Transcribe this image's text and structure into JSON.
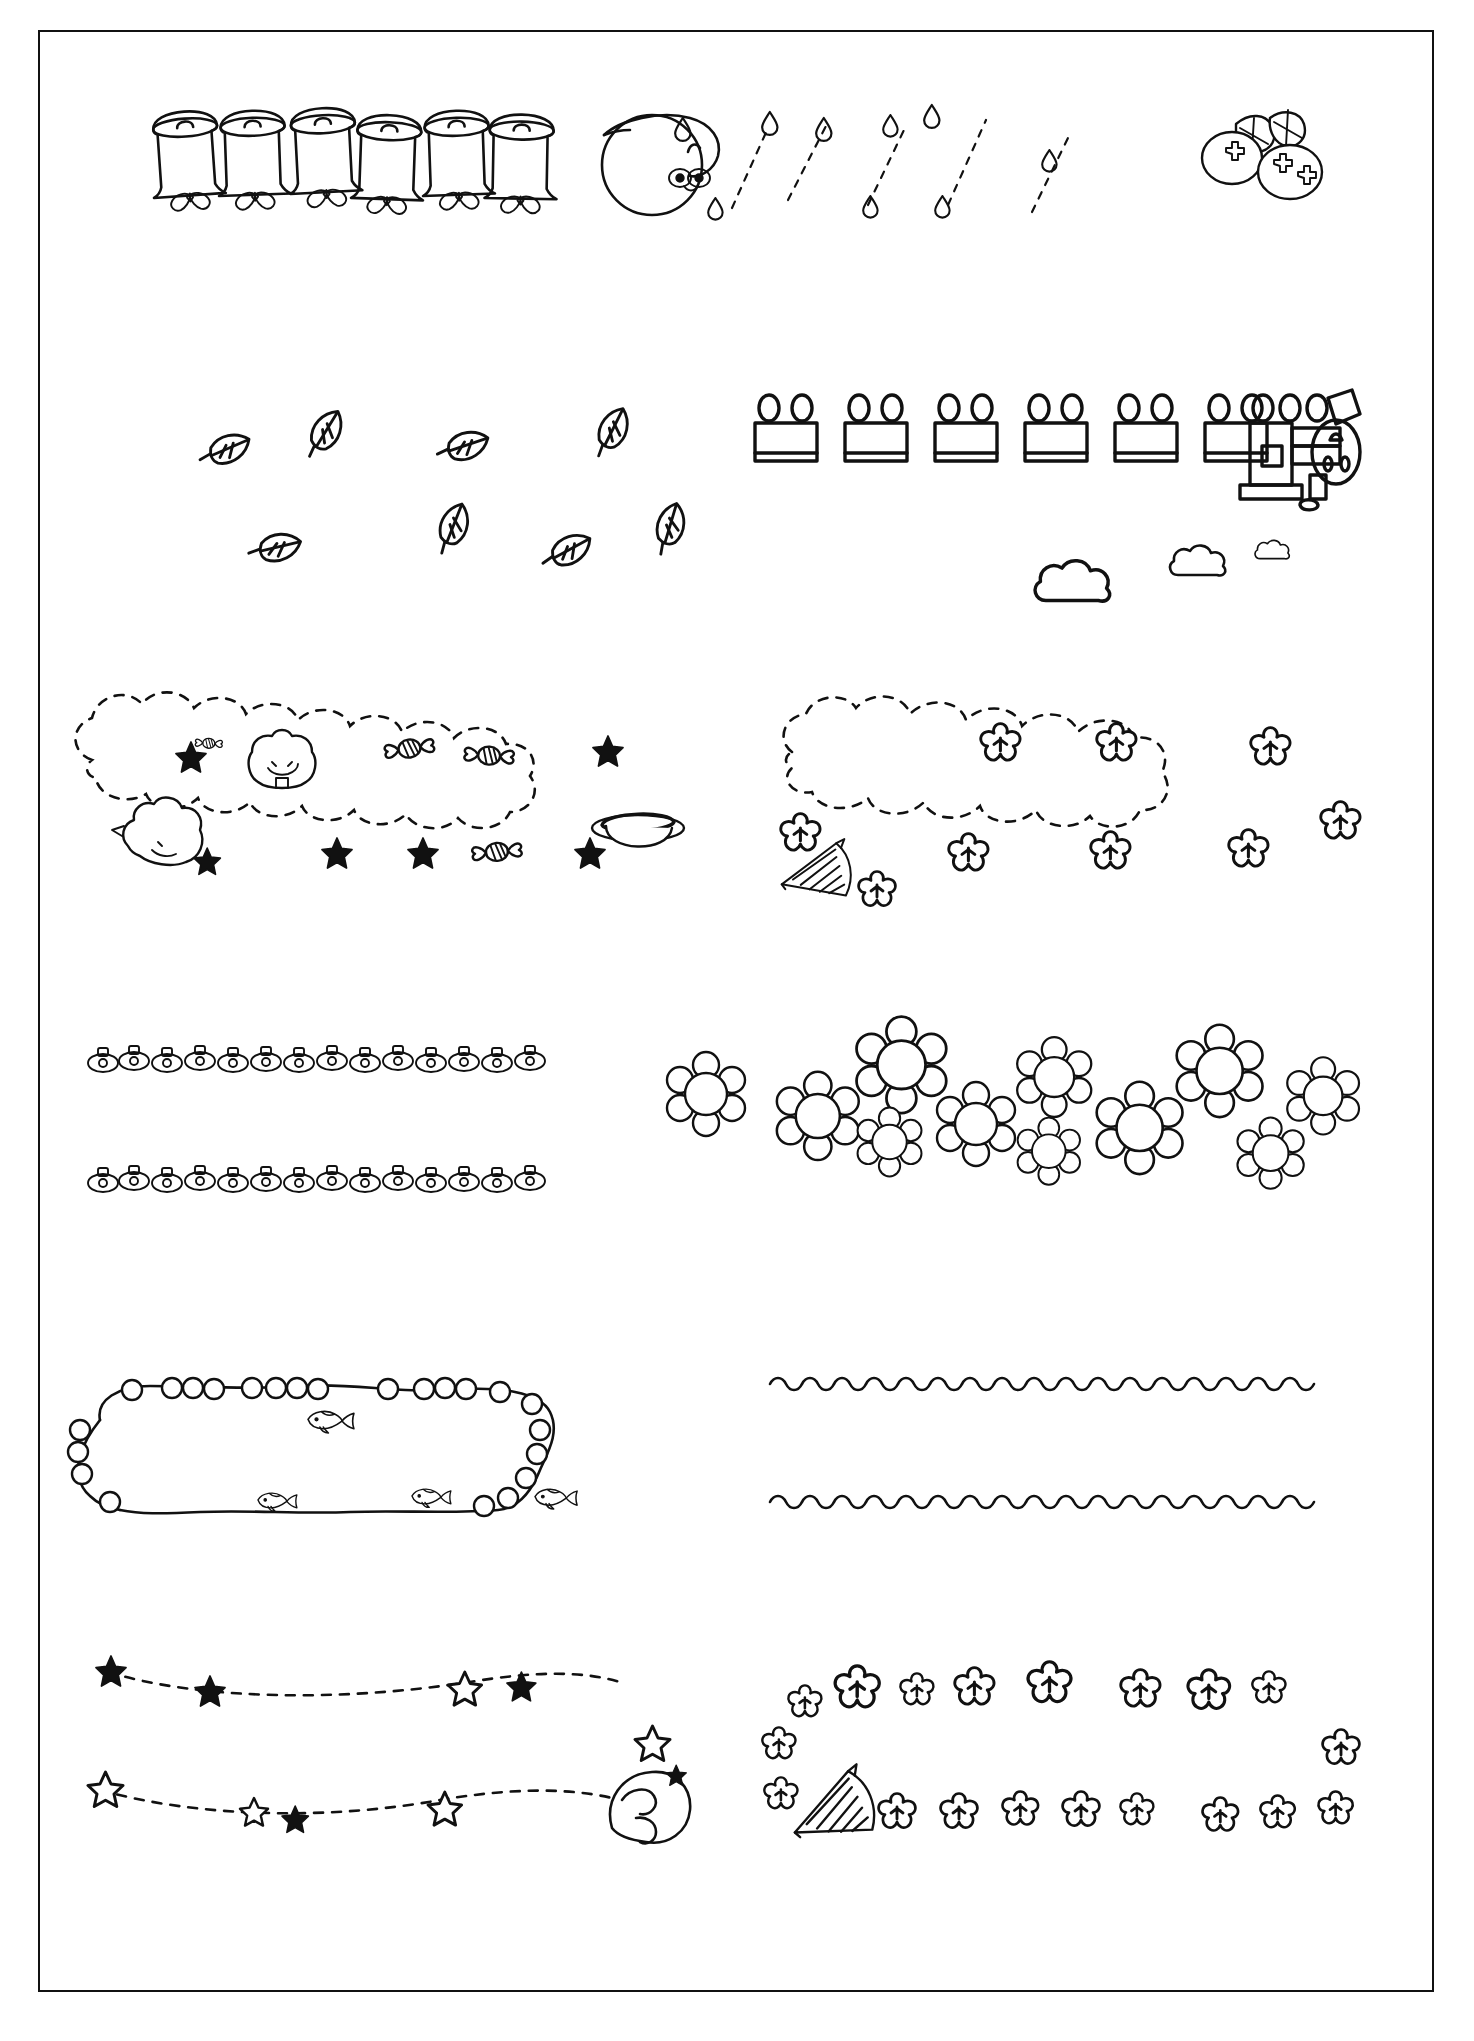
{
  "page": {
    "background_color": "#ffffff",
    "ink_color": "#111111",
    "border": {
      "visible": true,
      "color": "#111111",
      "width_px": 2
    },
    "width_px": 1474,
    "height_px": 2041,
    "style": "black-and-white line art, hand-drawn doodle borders",
    "text_content": "none — the sheet contains no words, labels, captions or numbers"
  },
  "rows": [
    {
      "index": 1,
      "left": {
        "name": "bells-with-bows-border",
        "description": "horizontal row of six hand-drawn hanging bells, each with a small loop handle on top and a ribbon bow beneath",
        "motif": "bell",
        "count": 6,
        "accessory": "bow"
      },
      "right": {
        "name": "snail-rain-border",
        "description": "a snail with round shell and antennae at left, followed by falling raindrops on dashed slanted trails, ending with a cluster of berries and leaves",
        "motifs": [
          "snail",
          "raindrop",
          "dashed-rain-trail",
          "berry-cluster",
          "leaf"
        ],
        "raindrop_count": 9,
        "berry_count": 3,
        "leaf_count": 2
      }
    },
    {
      "index": 2,
      "left": {
        "name": "falling-leaves-border",
        "description": "scattered simple leaves with veins, drifting in two loose rows",
        "motif": "leaf",
        "count": 8,
        "rows": 2
      },
      "right": {
        "name": "train-and-clouds-border",
        "description": "a side-view toy train: six rectangular carriages each topped with two rounded windows, pulled by a locomotive with chimney and square cab window, with three puffy smoke clouds trailing below-left",
        "motifs": [
          "train-carriage",
          "locomotive",
          "smoke-cloud"
        ],
        "carriage_count": 6,
        "windows_per_carriage": 2,
        "cloud_count": 3
      }
    },
    {
      "index": 3,
      "left": {
        "name": "candy-cloud-frame",
        "description": "rounded scalloped dashed cloud frame decorated with solid five-point stars, wrapped candies, a bear face and a sleeping cat, plus a small hat at lower right",
        "motifs": [
          "dashed-cloud-outline",
          "solid-star",
          "wrapped-candy",
          "bear-face",
          "cat",
          "hat"
        ],
        "star_count": 6,
        "candy_count": 4
      },
      "right": {
        "name": "blossom-cloud-frame",
        "description": "rounded scalloped dashed cloud frame dotted with small outlined cherry blossoms, with a folding fan tucked at the lower left corner",
        "motifs": [
          "dashed-cloud-outline",
          "blossom",
          "folding-fan"
        ],
        "blossom_count": 8
      }
    },
    {
      "index": 4,
      "left": {
        "name": "handbag-chain-border",
        "description": "two identical horizontal strips of small rounded handbag / purse outlines joined edge to edge",
        "motif": "handbag",
        "count_per_row": 14,
        "rows": 2
      },
      "right": {
        "name": "flower-cluster-border",
        "description": "dense overlapping cluster of simple round daisy flowers with circular centers forming a wide horizontal band",
        "motif": "daisy-flower",
        "count": 11
      }
    },
    {
      "index": 5,
      "left": {
        "name": "bubble-chain-fish-frame",
        "description": "open loop frame drawn as a strand of round bubbles / beads with small fish swimming along the inside",
        "motifs": [
          "bubble-bead",
          "fish"
        ],
        "fish_count": 4
      },
      "right": {
        "name": "wave-lines-divider",
        "description": "two long horizontal scalloped wave lines used as rule dividers",
        "motif": "wave-line",
        "count": 2
      }
    },
    {
      "index": 6,
      "left": {
        "name": "stars-and-moon-border",
        "description": "two long dashed trails strung with solid and outlined five-point stars, ending at a crescent sleeping moon at lower right",
        "motifs": [
          "dashed-trail",
          "solid-star",
          "outline-star",
          "crescent-moon"
        ],
        "star_count": 12
      },
      "right": {
        "name": "cherry-blossom-fan-border",
        "description": "two loose rows of outlined cherry blossoms with an open folding fan at the start of the lower row",
        "motifs": [
          "blossom",
          "folding-fan"
        ],
        "blossom_count": 18,
        "rows": 2
      }
    }
  ],
  "colors": {
    "ink": "#111111",
    "paper": "#ffffff"
  }
}
